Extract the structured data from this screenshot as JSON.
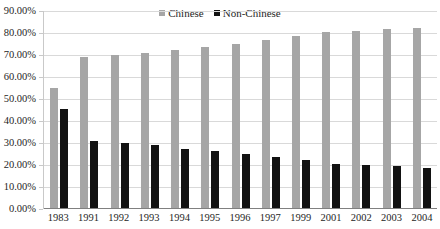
{
  "chart_data": {
    "type": "bar",
    "title": "",
    "xlabel": "",
    "ylabel": "",
    "ylim": [
      0,
      90
    ],
    "ytick_labels": [
      "90.00%",
      "80.00%",
      "70.00%",
      "60.00%",
      "50.00%",
      "40.00%",
      "30.00%",
      "20.00%",
      "10.00%",
      "0.00%"
    ],
    "ytick_values": [
      90,
      80,
      70,
      60,
      50,
      40,
      30,
      20,
      10,
      0
    ],
    "grid": true,
    "legend_position": "top-center",
    "categories": [
      "1983",
      "1991",
      "1992",
      "1993",
      "1994",
      "1995",
      "1996",
      "1997",
      "1999",
      "2001",
      "2002",
      "2003",
      "2004"
    ],
    "series": [
      {
        "name": "Chinese",
        "color": "#a6a6a6",
        "values": [
          55.0,
          69.0,
          70.0,
          71.0,
          72.5,
          73.5,
          75.0,
          77.0,
          78.5,
          80.5,
          81.0,
          82.0,
          82.5
        ]
      },
      {
        "name": "Non-Chinese",
        "color": "#121212",
        "values": [
          45.5,
          31.0,
          30.0,
          29.0,
          27.5,
          26.5,
          25.0,
          23.5,
          22.5,
          20.5,
          20.0,
          19.5,
          18.5
        ]
      }
    ]
  },
  "legend": {
    "items": [
      {
        "label": "Chinese",
        "color": "#a6a6a6"
      },
      {
        "label": "Non-Chinese",
        "color": "#121212"
      }
    ]
  }
}
